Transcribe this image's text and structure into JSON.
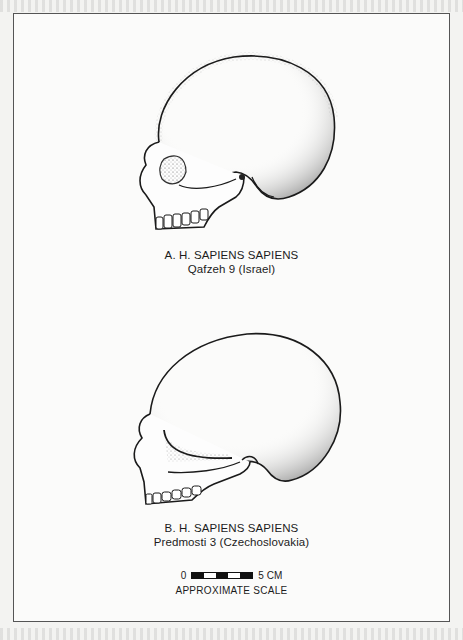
{
  "figure": {
    "specimens": [
      {
        "letter": "A.",
        "taxon": "H. SAPIENS SAPIENS",
        "title": "A. H. SAPIENS SAPIENS",
        "specimen": "Qafzeh 9 (Israel)",
        "view": "skull-lateral-left"
      },
      {
        "letter": "B.",
        "taxon": "H. SAPIENS SAPIENS",
        "title": "B. H. SAPIENS SAPIENS",
        "specimen": "Predmosti 3 (Czechoslovakia)",
        "view": "skull-lateral-left"
      }
    ],
    "scale": {
      "start_label": "0",
      "end_label": "5 CM",
      "caption": "APPROXIMATE SCALE",
      "segments": [
        "black",
        "white",
        "black",
        "white",
        "black"
      ]
    }
  },
  "colors": {
    "ink": "#1c1c1c",
    "paper": "#fbfbfa",
    "frame": "#555555"
  }
}
